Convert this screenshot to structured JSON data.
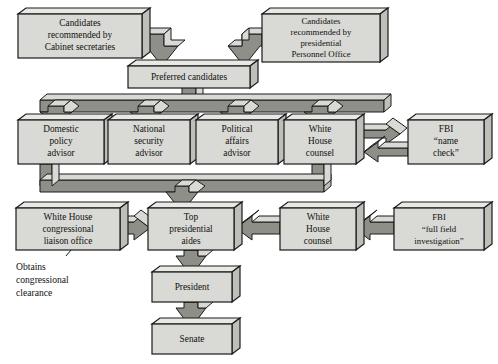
{
  "diagram": {
    "colors": {
      "box_face": "#d9d9d5",
      "box_top": "#e8e8e4",
      "box_side": "#bfbfba",
      "arrow_face": "#8f8f8a",
      "arrow_light": "#d9d9d5",
      "outline": "#1a1a1a",
      "text": "#111111",
      "background": "#ffffff"
    },
    "nodes": [
      {
        "id": "candidates-cabinet",
        "lines": [
          "Candidates",
          "recommended by",
          "Cabinet secretaries"
        ],
        "x": 18,
        "y": 14,
        "w": 124,
        "h": 44
      },
      {
        "id": "candidates-personnel",
        "lines": [
          "Candidates",
          "recommended by",
          "presidential",
          "Personnel Office"
        ],
        "x": 262,
        "y": 14,
        "w": 118,
        "h": 48
      },
      {
        "id": "preferred-candidates",
        "lines": [
          "Preferred candidates"
        ],
        "x": 128,
        "y": 66,
        "w": 122,
        "h": 22
      },
      {
        "id": "domestic-policy-advisor",
        "lines": [
          "Domestic",
          "policy",
          "advisor"
        ],
        "x": 18,
        "y": 120,
        "w": 86,
        "h": 44
      },
      {
        "id": "national-security-advisor",
        "lines": [
          "National",
          "security",
          "advisor"
        ],
        "x": 108,
        "y": 120,
        "w": 82,
        "h": 44
      },
      {
        "id": "political-affairs-advisor",
        "lines": [
          "Political",
          "affairs",
          "advisor"
        ],
        "x": 196,
        "y": 120,
        "w": 82,
        "h": 44
      },
      {
        "id": "white-house-counsel-top",
        "lines": [
          "White",
          "House",
          "counsel"
        ],
        "x": 284,
        "y": 120,
        "w": 72,
        "h": 44
      },
      {
        "id": "fbi-name-check",
        "lines": [
          "FBI",
          "“name",
          "check”"
        ],
        "x": 408,
        "y": 120,
        "w": 76,
        "h": 44
      },
      {
        "id": "wh-congressional-liaison",
        "lines": [
          "White House",
          "congressional",
          "liaison office"
        ],
        "x": 16,
        "y": 208,
        "w": 104,
        "h": 42
      },
      {
        "id": "top-presidential-aides",
        "lines": [
          "Top",
          "presidential",
          "aides"
        ],
        "x": 148,
        "y": 208,
        "w": 86,
        "h": 42
      },
      {
        "id": "white-house-counsel-bottom",
        "lines": [
          "White",
          "House",
          "counsel"
        ],
        "x": 280,
        "y": 208,
        "w": 76,
        "h": 42
      },
      {
        "id": "fbi-full-field-investigation",
        "lines": [
          "FBI",
          "“full field",
          "investigation”"
        ],
        "x": 394,
        "y": 208,
        "w": 90,
        "h": 42
      },
      {
        "id": "president",
        "lines": [
          "President"
        ],
        "x": 152,
        "y": 272,
        "w": 80,
        "h": 30
      },
      {
        "id": "senate",
        "lines": [
          "Senate"
        ],
        "x": 152,
        "y": 324,
        "w": 80,
        "h": 30
      }
    ],
    "annotations": [
      {
        "id": "obtains-congressional-clearance",
        "lines": [
          "Obtains",
          "congressional",
          "clearance"
        ],
        "x": 16,
        "y": 262
      }
    ],
    "edges": [
      {
        "id": "cabinet-to-preferred",
        "from": "candidates-cabinet",
        "to": "preferred-candidates",
        "direction": "down-right"
      },
      {
        "id": "personnel-to-preferred",
        "from": "candidates-personnel",
        "to": "preferred-candidates",
        "direction": "down-left"
      },
      {
        "id": "preferred-to-advisors",
        "from": "preferred-candidates",
        "to": "advisor-row",
        "direction": "down-fanout",
        "branches": 4
      },
      {
        "id": "advisors-to-aides",
        "from": "advisor-row",
        "to": "top-presidential-aides",
        "direction": "down-merge"
      },
      {
        "id": "counsel-to-fbi-name-check",
        "from": "white-house-counsel-top",
        "to": "fbi-name-check",
        "direction": "right"
      },
      {
        "id": "fbi-name-check-to-counsel",
        "from": "fbi-name-check",
        "to": "white-house-counsel-top",
        "direction": "left"
      },
      {
        "id": "liaison-to-aides",
        "from": "wh-congressional-liaison",
        "to": "top-presidential-aides",
        "direction": "right"
      },
      {
        "id": "counsel-to-aides",
        "from": "white-house-counsel-bottom",
        "to": "top-presidential-aides",
        "direction": "left"
      },
      {
        "id": "fbi-investigation-to-counsel",
        "from": "fbi-full-field-investigation",
        "to": "white-house-counsel-bottom",
        "direction": "left"
      },
      {
        "id": "aides-to-president",
        "from": "top-presidential-aides",
        "to": "president",
        "direction": "down"
      },
      {
        "id": "president-to-senate",
        "from": "president",
        "to": "senate",
        "direction": "down"
      }
    ]
  }
}
